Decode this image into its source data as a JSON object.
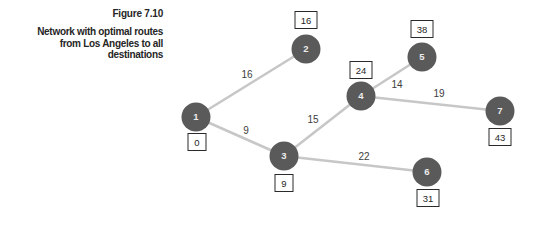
{
  "figure": {
    "label": "Figure 7.10",
    "caption_lines": [
      "Network with optimal routes",
      "from Los Angeles to all",
      "destinations"
    ]
  },
  "colors": {
    "node_fill": "#5a5a5a",
    "node_text": "#ececec",
    "edge_stroke": "#c7c7c7",
    "edge_label_text": "#3d3d3d",
    "box_fill": "#ffffff",
    "box_border": "#2a2a2a",
    "box_text": "#1f1f1f",
    "caption_text": "#262626"
  },
  "network": {
    "nodes": [
      {
        "id": "1",
        "x": 196,
        "y": 117,
        "distance": "0",
        "box_x": 197,
        "box_y": 142
      },
      {
        "id": "2",
        "x": 306,
        "y": 49,
        "distance": "16",
        "box_x": 306,
        "box_y": 20
      },
      {
        "id": "3",
        "x": 284,
        "y": 156,
        "distance": "9",
        "box_x": 284,
        "box_y": 183
      },
      {
        "id": "4",
        "x": 361,
        "y": 96,
        "distance": "24",
        "box_x": 361,
        "box_y": 70
      },
      {
        "id": "5",
        "x": 422,
        "y": 57,
        "distance": "38",
        "box_x": 422,
        "box_y": 29
      },
      {
        "id": "6",
        "x": 427,
        "y": 172,
        "distance": "31",
        "box_x": 428,
        "box_y": 198
      },
      {
        "id": "7",
        "x": 500,
        "y": 111,
        "distance": "43",
        "box_x": 500,
        "box_y": 137
      }
    ],
    "edges": [
      {
        "from": "1",
        "to": "2",
        "weight": "16",
        "label_x": 247,
        "label_y": 74
      },
      {
        "from": "1",
        "to": "3",
        "weight": "9",
        "label_x": 246,
        "label_y": 130
      },
      {
        "from": "3",
        "to": "4",
        "weight": "15",
        "label_x": 313,
        "label_y": 119
      },
      {
        "from": "3",
        "to": "6",
        "weight": "22",
        "label_x": 364,
        "label_y": 156
      },
      {
        "from": "4",
        "to": "5",
        "weight": "14",
        "label_x": 397,
        "label_y": 84
      },
      {
        "from": "4",
        "to": "7",
        "weight": "19",
        "label_x": 439,
        "label_y": 93
      }
    ],
    "node_radius": 14.5,
    "edge_width": 2.6
  }
}
